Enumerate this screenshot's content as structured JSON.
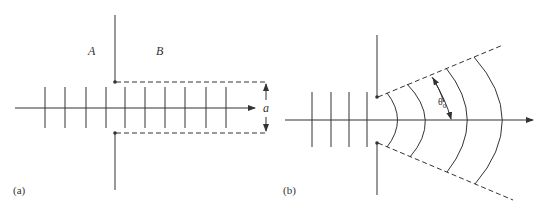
{
  "figure": {
    "panel_a": {
      "label": "(a)",
      "region_left": "A",
      "region_right": "B",
      "aperture_dimension": "a",
      "plane_wave_lines_count": 10
    },
    "panel_b": {
      "label": "(b)",
      "angle_label": "θ",
      "angle_subscript": "0",
      "plane_wave_lines_count": 4,
      "spherical_wavefronts_count": 4
    },
    "colors": {
      "line": "#333333",
      "background": "#ffffff"
    }
  }
}
